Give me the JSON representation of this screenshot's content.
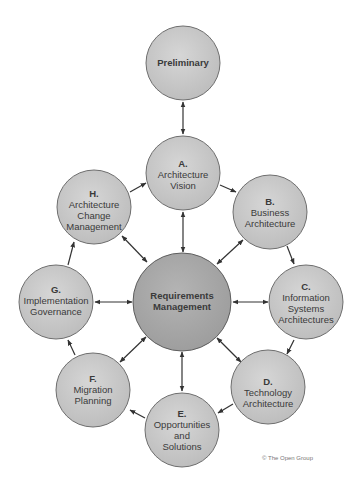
{
  "diagram": {
    "colors": {
      "node_fill": "#c8c8c8",
      "node_stroke": "#6e6e6e",
      "center_fill": "#a9a9a9",
      "arrow": "#333333",
      "text": "#3a3a3a"
    },
    "nodes": {
      "preliminary": {
        "lines": [
          "Preliminary"
        ],
        "bold": true
      },
      "a": {
        "letter": "A.",
        "lines": [
          "Architecture",
          "Vision"
        ]
      },
      "b": {
        "letter": "B.",
        "lines": [
          "Business",
          "Architecture"
        ]
      },
      "c": {
        "letter": "C.",
        "lines": [
          "Information",
          "Systems",
          "Architectures"
        ]
      },
      "d": {
        "letter": "D.",
        "lines": [
          "Technology",
          "Architecture"
        ]
      },
      "e": {
        "letter": "E.",
        "lines": [
          "Opportunities",
          "and",
          "Solutions"
        ]
      },
      "f": {
        "letter": "F.",
        "lines": [
          "Migration",
          "Planning"
        ]
      },
      "g": {
        "letter": "G.",
        "lines": [
          "Implementation",
          "Governance"
        ]
      },
      "h": {
        "letter": "H.",
        "lines": [
          "Architecture",
          "Change",
          "Management"
        ]
      },
      "center": {
        "lines": [
          "Requirements",
          "Management"
        ],
        "bold": true
      }
    },
    "copyright": "© The Open Group"
  }
}
